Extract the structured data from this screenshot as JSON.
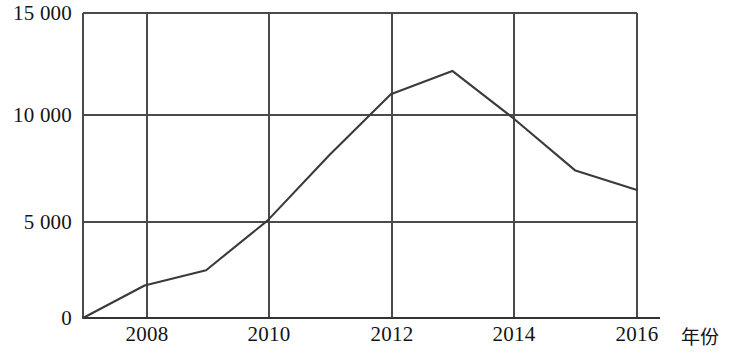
{
  "chart_data": {
    "type": "line",
    "title": "",
    "subtitle": "",
    "xlabel": "年份",
    "ylabel": "",
    "x": [
      2007,
      2008,
      2009,
      2010,
      2011,
      2012,
      2013,
      2014,
      2015,
      2016
    ],
    "values": [
      0,
      1600,
      2350,
      4800,
      8000,
      11000,
      12150,
      9800,
      7250,
      6300
    ],
    "series": [
      {
        "name": "",
        "values": [
          0,
          1600,
          2350,
          4800,
          8000,
          11000,
          12150,
          9800,
          7250,
          6300
        ]
      }
    ],
    "xlim": [
      2007,
      2016
    ],
    "ylim": [
      0,
      15000
    ],
    "x_ticks": [
      2008,
      2010,
      2012,
      2014,
      2016
    ],
    "x_tick_labels": [
      "2008",
      "2010",
      "2012",
      "2014",
      "2016"
    ],
    "y_ticks": [
      0,
      5000,
      10000,
      15000
    ],
    "y_tick_labels": [
      "0",
      "5 000",
      "10 000",
      "15 000"
    ],
    "grid": true,
    "grid_x": true,
    "grid_y": true,
    "legend": false,
    "legend_position": "none",
    "line_color": "#3a3a3a",
    "grid_color": "#4a4a4a",
    "axis_color": "#333333",
    "background_color": "#ffffff",
    "markers": false,
    "annotations": []
  },
  "axis": {
    "x_name": "年份",
    "y_ticks": [
      {
        "label": "15 000",
        "value": 15000
      },
      {
        "label": "10 000",
        "value": 10000
      },
      {
        "label": "5 000",
        "value": 5000
      },
      {
        "label": "0",
        "value": 0
      }
    ],
    "x_ticks": [
      {
        "label": "2008",
        "value": 2008
      },
      {
        "label": "2010",
        "value": 2010
      },
      {
        "label": "2012",
        "value": 2012
      },
      {
        "label": "2014",
        "value": 2014
      },
      {
        "label": "2016",
        "value": 2016
      }
    ]
  }
}
